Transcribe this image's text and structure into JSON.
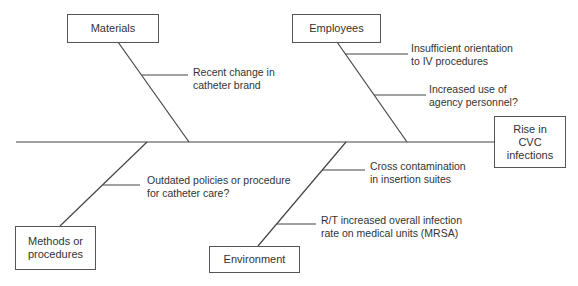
{
  "diagram": {
    "type": "fishbone",
    "effect": "Rise in CVC infections",
    "effect_lines": [
      "Rise in",
      "CVC",
      "infections"
    ],
    "categories": [
      {
        "name": "Materials",
        "lines": [
          "Materials"
        ],
        "causes": [
          [
            "Recent change in",
            "catheter brand"
          ]
        ]
      },
      {
        "name": "Employees",
        "lines": [
          "Employees"
        ],
        "causes": [
          [
            "Insufficient orientation",
            "to IV procedures"
          ],
          [
            "Increased use of",
            "agency personnel?"
          ]
        ]
      },
      {
        "name": "Methods or procedures",
        "lines": [
          "Methods or",
          "procedures"
        ],
        "causes": [
          [
            "Outdated policies or procedure",
            "for catheter care?"
          ]
        ]
      },
      {
        "name": "Environment",
        "lines": [
          "Environment"
        ],
        "causes": [
          [
            "Cross contamination",
            "in insertion suites"
          ],
          [
            "R/T increased overall infection",
            "rate on medical units (MRSA)"
          ]
        ]
      }
    ]
  }
}
